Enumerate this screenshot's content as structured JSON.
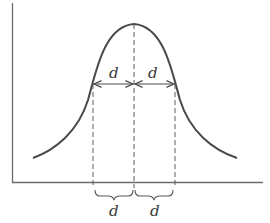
{
  "diagram": {
    "type": "bell-curve-symmetric-distance",
    "colors": {
      "stroke": "#4a4a4a",
      "axis": "#6a6a6a",
      "dash": "#5a5a5a",
      "background": "#ffffff"
    },
    "axes": {
      "origin": [
        12,
        182
      ],
      "y_top": 3,
      "x_right": 263
    },
    "curve": {
      "left_tail": [
        33,
        158
      ],
      "peak": [
        134,
        24
      ],
      "right_tail": [
        237,
        158
      ]
    },
    "upper_labels": {
      "left": "d",
      "right": "d"
    },
    "lower_labels": {
      "left": "d",
      "right": "d"
    },
    "markers": {
      "left_x": 93,
      "center_x": 134,
      "right_x": 175,
      "arrow_y": 84
    }
  }
}
